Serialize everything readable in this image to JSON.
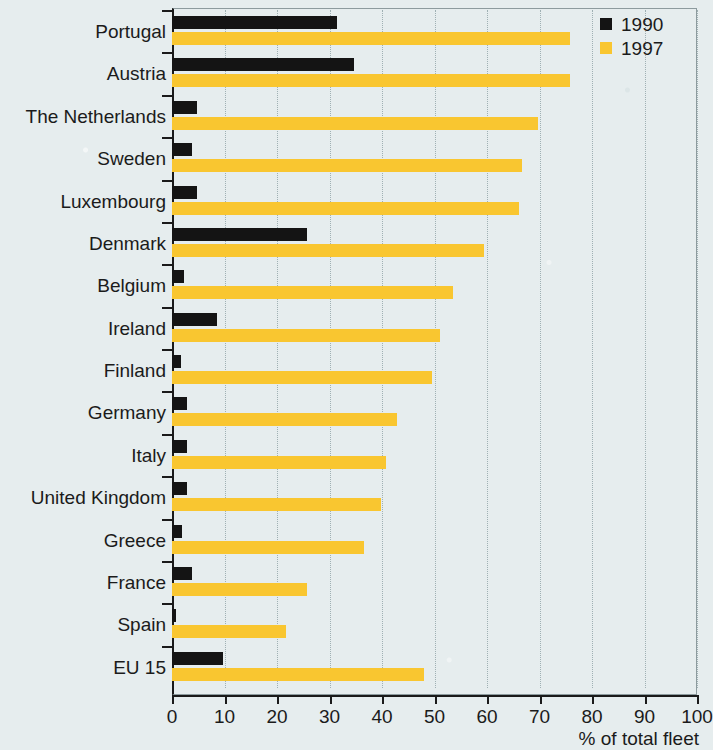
{
  "chart_data": {
    "type": "bar",
    "orientation": "horizontal",
    "title": "",
    "subtitle": "",
    "xlabel": "% of total fleet",
    "ylabel": "",
    "xlim": [
      0,
      100
    ],
    "xticks": [
      0,
      10,
      20,
      30,
      40,
      50,
      60,
      70,
      80,
      90,
      100
    ],
    "xticklabels": [
      "0",
      "10",
      "20",
      "30",
      "40",
      "50",
      "60",
      "70",
      "80",
      "90",
      "100"
    ],
    "grid": "vertical dotted gridlines at every x tick",
    "legend_position": "top-right",
    "categories": [
      "Portugal",
      "Austria",
      "The Netherlands",
      "Sweden",
      "Luxembourg",
      "Denmark",
      "Belgium",
      "Ireland",
      "Finland",
      "Germany",
      "Italy",
      "United Kingdom",
      "Greece",
      "France",
      "Spain",
      "EU 15"
    ],
    "series": [
      {
        "name": "1990",
        "color": "#141414",
        "values": [
          31.5,
          34.7,
          4.7,
          3.8,
          4.7,
          25.8,
          2.3,
          8.5,
          1.8,
          2.8,
          2.8,
          2.8,
          1.9,
          3.8,
          0.8,
          9.7
        ]
      },
      {
        "name": "1997",
        "color": "#f9c630",
        "values": [
          75.8,
          75.8,
          69.7,
          66.6,
          66.0,
          59.4,
          53.6,
          51.0,
          49.5,
          42.8,
          40.8,
          39.8,
          36.6,
          25.8,
          21.8,
          48.0
        ]
      }
    ]
  },
  "legend": {
    "items": [
      {
        "label": "1990",
        "color": "#141414",
        "swatch": "square-swatch-black"
      },
      {
        "label": "1997",
        "color": "#f9c630",
        "swatch": "square-swatch-yellow"
      }
    ]
  },
  "axis": {
    "x_title": "% of total fleet"
  },
  "colors": {
    "background": "#e6edee",
    "series_1990": "#141414",
    "series_1997": "#f9c630",
    "axis": "#1a1a1a",
    "grid": "#9fb0b3"
  }
}
